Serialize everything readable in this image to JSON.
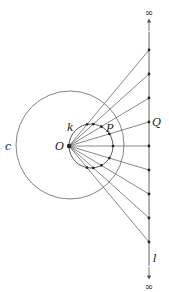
{
  "diagram": {
    "labels": {
      "c": "c",
      "k": "k",
      "O": "O",
      "P": "P",
      "Q": "Q",
      "l": "l",
      "infinity_top": "∞",
      "infinity_bottom": "∞"
    },
    "geometry": {
      "O": [
        69,
        146
      ],
      "circle_c": {
        "cx": 70,
        "cy": 145,
        "r": 54
      },
      "circle_k": {
        "cx": 91,
        "cy": 146,
        "r": 22
      },
      "line_l_x": 149,
      "line_l_y_range": [
        32,
        266
      ],
      "points_on_l_y": [
        50,
        74,
        98,
        122,
        146,
        170,
        194,
        218,
        242
      ],
      "Q_index": 3
    },
    "colors": {
      "stroke": "#555555",
      "dot": "#222222"
    }
  }
}
